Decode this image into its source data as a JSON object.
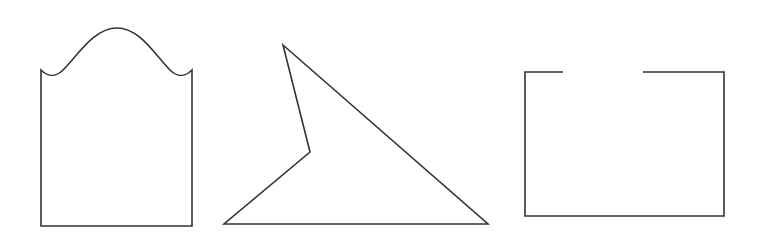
{
  "figure": {
    "background_color": "#ffffff",
    "stroke_color": "#333333",
    "stroke_width": 1.6,
    "canvas": {
      "width": 759,
      "height": 237
    }
  },
  "shapes": [
    {
      "id": "curved-top-rectangle",
      "name": "Rectangle with wavy arched top",
      "type": "closed-outline",
      "fill": "none",
      "bounds": {
        "x": 41,
        "y": 28,
        "width": 151,
        "height": 198
      },
      "path": "M 41 70 L 41 226 L 192 226 L 192 70 C 185 77 177 77 170 70 C 155 55 140 28 117 28 C 94 28 78 55 63 70 C 56 77 48 77 41 70 Z"
    },
    {
      "id": "concave-arrow-quadrilateral",
      "name": "Concave quadrilateral with notch",
      "type": "closed-polygon",
      "fill": "none",
      "bounds": {
        "x": 224,
        "y": 45,
        "width": 264,
        "height": 179
      },
      "vertices": [
        {
          "label": "apex-top",
          "x": 283,
          "y": 45
        },
        {
          "label": "bottom-right",
          "x": 488,
          "y": 224
        },
        {
          "label": "bottom-left",
          "x": 224,
          "y": 224
        },
        {
          "label": "notch-reflex",
          "x": 310,
          "y": 152
        }
      ],
      "path": "M 283 45 L 488 224 L 224 224 L 310 152 Z"
    },
    {
      "id": "rectangle-with-top-gap",
      "name": "Rectangle with gap in top edge",
      "type": "open-outline",
      "fill": "none",
      "bounds": {
        "x": 525,
        "y": 72,
        "width": 199,
        "height": 144
      },
      "gap": {
        "edge": "top",
        "from_x": 563,
        "to_x": 643
      },
      "path": "M 563 72 L 525 72 L 525 216 L 724 216 L 724 72 L 643 72"
    }
  ]
}
